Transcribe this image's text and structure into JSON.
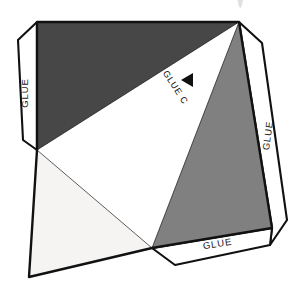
{
  "document": {
    "title": "Papercraft Net Template",
    "background_color": "#ffffff",
    "width": 303,
    "height": 290
  },
  "palette": {
    "outline": "#111111",
    "dark_face": "#474747",
    "mid_face": "#808080",
    "white_face": "#ffffff",
    "light_face": "#f5f4f2",
    "tab_fill": "#ffffff",
    "label_text": "#1a1a1a",
    "faint_mark": "#c9c9c9"
  },
  "labels": {
    "glue_left": "GLUE",
    "glue_right": "GLUE",
    "glue_bottom": "GLUE",
    "glue_c": "GLUE C"
  },
  "markers": {
    "arrow_c": "left-pointing-triangle"
  },
  "faces": [
    {
      "name": "dark-upper-face",
      "shade": "dark",
      "color": "#474747"
    },
    {
      "name": "white-center-face",
      "shade": "white",
      "color": "#ffffff"
    },
    {
      "name": "mid-right-face",
      "shade": "medium",
      "color": "#808080"
    },
    {
      "name": "light-lower-left-face",
      "shade": "light",
      "color": "#f5f4f2"
    },
    {
      "name": "white-lower-face",
      "shade": "white",
      "color": "#ffffff"
    }
  ],
  "tabs": [
    {
      "name": "glue-tab-left",
      "label": "GLUE",
      "orientation": "vertical"
    },
    {
      "name": "glue-tab-right",
      "label": "GLUE",
      "orientation": "vertical"
    },
    {
      "name": "glue-tab-bottom",
      "label": "GLUE",
      "orientation": "horizontal"
    }
  ]
}
